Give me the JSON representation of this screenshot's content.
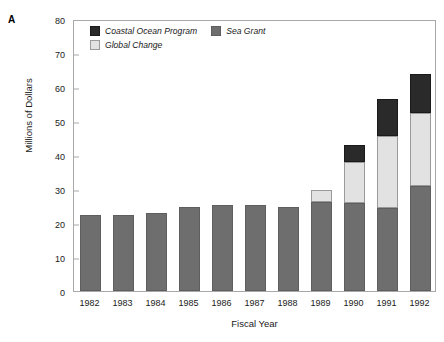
{
  "panel": {
    "letter": "A"
  },
  "chart_data": {
    "type": "bar",
    "stacked": true,
    "title": "",
    "xlabel": "Fiscal Year",
    "ylabel": "Millions of Dollars",
    "categories": [
      "1982",
      "1983",
      "1984",
      "1985",
      "1986",
      "1987",
      "1988",
      "1989",
      "1990",
      "1991",
      "1992"
    ],
    "series": [
      {
        "name": "Sea Grant",
        "color": "#6e6e6e",
        "values": [
          22.5,
          22.5,
          23.0,
          24.8,
          25.3,
          25.3,
          24.8,
          26.3,
          26.0,
          24.3,
          30.8
        ]
      },
      {
        "name": "Global Change",
        "color": "#e2e2e2",
        "values": [
          0,
          0,
          0,
          0,
          0,
          0,
          0,
          3.5,
          12.0,
          21.2,
          21.7
        ]
      },
      {
        "name": "Coastal Ocean Program",
        "color": "#2a2a2a",
        "values": [
          0,
          0,
          0,
          0,
          0,
          0,
          0,
          0,
          5.0,
          11.0,
          11.3
        ]
      }
    ],
    "totals": [
      22.5,
      22.5,
      23.0,
      24.8,
      25.3,
      25.3,
      24.8,
      29.8,
      43.0,
      56.5,
      63.8
    ],
    "ylim": [
      0,
      80
    ],
    "yticks": [
      0,
      10,
      20,
      30,
      40,
      50,
      60,
      70,
      80
    ],
    "ytick_labels": [
      "0",
      "10",
      "20",
      "30",
      "40",
      "50",
      "60",
      "70",
      "80"
    ],
    "grid": false,
    "legend_position": "top-left-inside",
    "legend": [
      {
        "label": "Coastal Ocean Program",
        "swatch": "sw-coastal"
      },
      {
        "label": "Sea Grant",
        "swatch": "sw-sea"
      },
      {
        "label": "Global Change",
        "swatch": "sw-global"
      }
    ],
    "colors": {
      "sea_grant": "#6e6e6e",
      "global_change": "#e2e2e2",
      "coastal_ocean_program": "#2a2a2a",
      "axis": "#a8a8a8"
    }
  }
}
